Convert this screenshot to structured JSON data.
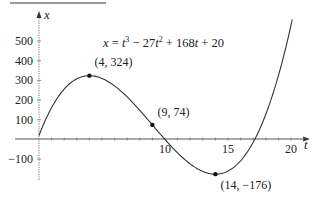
{
  "chart_data": {
    "type": "line",
    "formula": {
      "lhs": "x",
      "eq": " = ",
      "t1": "t",
      "e1": "3",
      "mid1": " − 27",
      "t2": "t",
      "e2": "2",
      "mid2": " + 168",
      "t3": "t",
      "end": " + 20"
    },
    "xlabel": "t",
    "ylabel": "x",
    "xlim": [
      0,
      20.1
    ],
    "ylim": [
      -176,
      600
    ],
    "x_ticks": [
      10,
      15,
      20
    ],
    "x_tick_labels": [
      "10",
      "15",
      "20"
    ],
    "y_ticks": [
      -100,
      100,
      200,
      300,
      400,
      500
    ],
    "y_tick_labels": [
      "−100",
      "100",
      "200",
      "300",
      "400",
      "500"
    ],
    "grid": false,
    "series": [
      {
        "name": "x(t) = t^3 − 27t^2 + 168t + 20",
        "x": [
          0,
          1,
          2,
          3,
          4,
          5,
          6,
          7,
          8,
          9,
          10,
          11,
          12,
          13,
          14,
          15,
          16,
          17,
          18,
          19,
          20
        ],
        "values": [
          20,
          162,
          264,
          308,
          324,
          310,
          272,
          216,
          148,
          74,
          0,
          -68,
          -124,
          -162,
          -176,
          -160,
          -108,
          -14,
          128,
          324,
          580
        ]
      }
    ],
    "annotations": [
      {
        "t": 4,
        "x": 324,
        "label": "(4, 324)"
      },
      {
        "t": 9,
        "x": 74,
        "label": "(9, 74)"
      },
      {
        "t": 14,
        "x": -176,
        "label": "(14, −176)"
      }
    ]
  }
}
